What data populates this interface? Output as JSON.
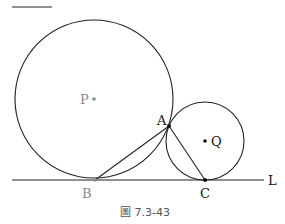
{
  "figure": {
    "caption": "圖 7.3-43",
    "top_fragment": "A",
    "colors": {
      "stroke": "#222222",
      "faded": "#8a8a8a",
      "point": "#111111"
    },
    "circle_p": {
      "label": "P",
      "cx": 94,
      "cy": 99,
      "r": 79
    },
    "circle_q": {
      "label": "Q",
      "cx": 205,
      "cy": 141,
      "r": 39
    },
    "line_l": {
      "label": "L",
      "x1": 12,
      "x2": 264,
      "y": 180
    },
    "points": {
      "A": {
        "label": "A",
        "x": 169,
        "y": 126
      },
      "B": {
        "label": "B",
        "x": 95,
        "y": 180
      },
      "C": {
        "label": "C",
        "x": 205,
        "y": 180
      }
    }
  }
}
